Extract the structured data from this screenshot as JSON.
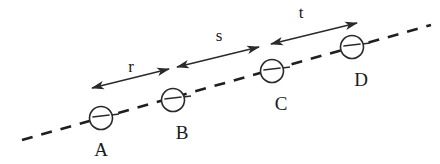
{
  "figure": {
    "background_color": "#ffffff",
    "ink_color": "#2a2a2a",
    "width": 440,
    "height": 164
  },
  "axis": {
    "name": "dashed-baseline",
    "style": "dashed",
    "color": "#1f1f1f",
    "x1": 22,
    "y1": 140,
    "x2": 431,
    "y2": 25,
    "dash_pattern": "11 9"
  },
  "points": [
    {
      "label": "A",
      "cx": 101,
      "cy": 118,
      "r": 11.5,
      "label_x": 101,
      "label_y": 156,
      "tick_x1": 89,
      "tick_y1": 118,
      "tick_x2": 119,
      "tick_y2": 114
    },
    {
      "label": "B",
      "cx": 173,
      "cy": 100,
      "r": 11.5,
      "label_x": 182,
      "label_y": 139,
      "tick_x1": 161,
      "tick_y1": 100,
      "tick_x2": 191,
      "tick_y2": 96
    },
    {
      "label": "C",
      "cx": 272,
      "cy": 71,
      "r": 11.5,
      "label_x": 281,
      "label_y": 110,
      "tick_x1": 260,
      "tick_y1": 71,
      "tick_x2": 290,
      "tick_y2": 67
    },
    {
      "label": "D",
      "cx": 352,
      "cy": 47,
      "r": 11.5,
      "label_x": 361,
      "label_y": 86,
      "tick_x1": 340,
      "tick_y1": 47,
      "tick_x2": 370,
      "tick_y2": 43
    }
  ],
  "segments": [
    {
      "label": "r",
      "x1": 92,
      "y1": 88,
      "x2": 169,
      "y2": 69,
      "label_x": 131,
      "label_y": 72,
      "arrow_start": true,
      "arrow_end": true
    },
    {
      "label": "s",
      "x1": 177,
      "y1": 67,
      "x2": 259,
      "y2": 47,
      "label_x": 219,
      "label_y": 41,
      "arrow_start": true,
      "arrow_end": true
    },
    {
      "label": "t",
      "x1": 271,
      "y1": 44,
      "x2": 357,
      "y2": 23,
      "label_x": 301,
      "label_y": 18,
      "arrow_start": true,
      "arrow_end": true
    }
  ],
  "chart_data": {
    "type": "diagram",
    "categories": [
      "A",
      "B",
      "C",
      "D"
    ],
    "segment_labels": [
      "r",
      "s",
      "t"
    ],
    "relations": [
      "r = distance from A to B",
      "s = distance from B to C",
      "t = distance from C to D"
    ],
    "point_positions_px": [
      {
        "label": "A",
        "x": 101,
        "y": 118
      },
      {
        "label": "B",
        "x": 173,
        "y": 100
      },
      {
        "label": "C",
        "x": 272,
        "y": 71
      },
      {
        "label": "D",
        "x": 352,
        "y": 47
      }
    ],
    "segment_spans_px": [
      {
        "label": "r",
        "from": "A",
        "to": "B",
        "length": 79
      },
      {
        "label": "s",
        "from": "B",
        "to": "C",
        "length": 84
      },
      {
        "label": "t",
        "from": "C",
        "to": "D",
        "length": 88
      }
    ],
    "xlabel": "",
    "ylabel": "",
    "grid": false,
    "legend": "none"
  }
}
